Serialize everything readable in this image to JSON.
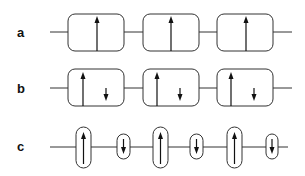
{
  "diagram": {
    "rows": [
      {
        "label": "a",
        "description": "uniform chain, one up spin per unit cell",
        "cells": [
          {
            "type": "box",
            "spins": [
              "up"
            ]
          },
          {
            "type": "box",
            "spins": [
              "up"
            ]
          },
          {
            "type": "box",
            "spins": [
              "up"
            ]
          }
        ]
      },
      {
        "label": "b",
        "description": "chain with large up spin and small down spin per unit cell",
        "cells": [
          {
            "type": "box",
            "spins": [
              "up",
              "down-small"
            ]
          },
          {
            "type": "box",
            "spins": [
              "up",
              "down-small"
            ]
          },
          {
            "type": "box",
            "spins": [
              "up",
              "down-small"
            ]
          }
        ]
      },
      {
        "label": "c",
        "description": "alternating large up and small down spins, each in its own pill",
        "cells": [
          {
            "type": "pill-large",
            "spins": [
              "up"
            ]
          },
          {
            "type": "pill-small",
            "spins": [
              "down"
            ]
          },
          {
            "type": "pill-large",
            "spins": [
              "up"
            ]
          },
          {
            "type": "pill-small",
            "spins": [
              "down"
            ]
          },
          {
            "type": "pill-large",
            "spins": [
              "up"
            ]
          },
          {
            "type": "pill-small",
            "spins": [
              "down"
            ]
          }
        ]
      }
    ],
    "colors": {
      "line": "#333333",
      "arrow": "#111111",
      "background": "#ffffff"
    }
  }
}
